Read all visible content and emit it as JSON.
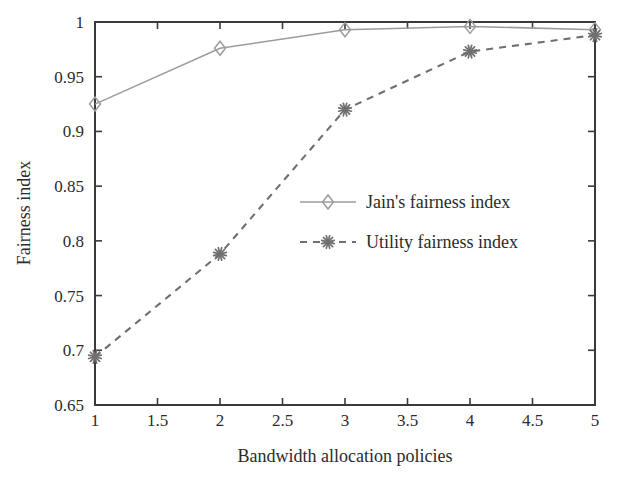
{
  "chart_data": {
    "type": "line",
    "title": "",
    "xlabel": "Bandwidth allocation policies",
    "ylabel": "Fairness index",
    "x": [
      1,
      2,
      3,
      4,
      5
    ],
    "xlim": [
      1,
      5
    ],
    "ylim": [
      0.65,
      1
    ],
    "xticks": [
      1,
      1.5,
      2,
      2.5,
      3,
      3.5,
      4,
      4.5,
      5
    ],
    "xtick_labels": [
      "1",
      "1.5",
      "2",
      "2.5",
      "3",
      "3.5",
      "4",
      "4.5",
      "5"
    ],
    "yticks": [
      0.65,
      0.7,
      0.75,
      0.8,
      0.85,
      0.9,
      0.95,
      1
    ],
    "ytick_labels": [
      "0.65",
      "0.7",
      "0.75",
      "0.8",
      "0.85",
      "0.9",
      "0.95",
      "1"
    ],
    "grid": false,
    "legend_position": "center",
    "series": [
      {
        "name": "Jain's fairness index",
        "values": [
          0.925,
          0.976,
          0.993,
          0.996,
          0.993
        ],
        "color": "#9c9c9c",
        "marker": "diamond",
        "linestyle": "solid"
      },
      {
        "name": "Utility fairness index",
        "values": [
          0.694,
          0.788,
          0.92,
          0.973,
          0.988
        ],
        "color": "#6f6f6f",
        "marker": "asterisk",
        "linestyle": "dashed"
      }
    ]
  },
  "legend": {
    "entries": [
      {
        "label": "Jain's fairness index"
      },
      {
        "label": "Utility fairness index"
      }
    ]
  },
  "axes": {
    "frame_color": "#3a3a3a"
  }
}
